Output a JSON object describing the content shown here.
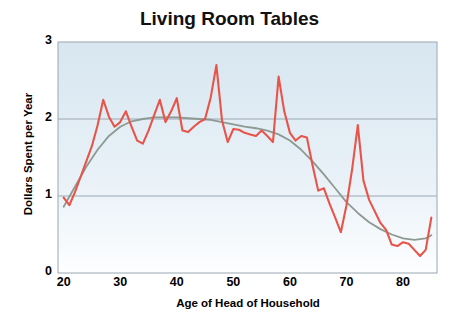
{
  "chart_data": {
    "type": "line",
    "title": "Living Room Tables",
    "xlabel": "Age of Head of Household",
    "ylabel": "Dollars Spent per Year",
    "xlim": [
      19,
      86
    ],
    "ylim": [
      0,
      3
    ],
    "xticks": [
      20,
      30,
      40,
      50,
      60,
      70,
      80
    ],
    "yticks": [
      0,
      1,
      2,
      3
    ],
    "grid": "horizontal-at-1-and-2",
    "legend": "none",
    "colors": {
      "data_line": "#e8544a",
      "trend_line": "#8d9a92",
      "plot_bg_top": "#d7e6f0",
      "plot_bg_bottom": "#fdfeff",
      "axis": "#8c9aa6",
      "gridline": "#9aa8b2",
      "text": "#000000"
    },
    "series": [
      {
        "name": "Dollars spent per year",
        "color": "#e8544a",
        "x": [
          20,
          21,
          22,
          23,
          24,
          25,
          26,
          27,
          28,
          29,
          30,
          31,
          32,
          33,
          34,
          35,
          36,
          37,
          38,
          39,
          40,
          41,
          42,
          43,
          44,
          45,
          46,
          47,
          48,
          49,
          50,
          51,
          52,
          53,
          54,
          55,
          56,
          57,
          58,
          59,
          60,
          61,
          62,
          63,
          64,
          65,
          66,
          67,
          68,
          69,
          70,
          71,
          72,
          73,
          74,
          75,
          76,
          77,
          78,
          79,
          80,
          81,
          82,
          83,
          84,
          85
        ],
        "values": [
          0.98,
          0.88,
          1.05,
          1.25,
          1.45,
          1.65,
          1.92,
          2.25,
          2.03,
          1.9,
          1.96,
          2.1,
          1.9,
          1.72,
          1.68,
          1.85,
          2.05,
          2.25,
          1.96,
          2.1,
          2.27,
          1.85,
          1.83,
          1.9,
          1.96,
          2.0,
          2.28,
          2.7,
          1.98,
          1.7,
          1.87,
          1.86,
          1.82,
          1.8,
          1.78,
          1.85,
          1.78,
          1.7,
          2.55,
          2.1,
          1.82,
          1.72,
          1.78,
          1.76,
          1.4,
          1.07,
          1.1,
          0.9,
          0.72,
          0.53,
          0.88,
          1.35,
          1.92,
          1.2,
          0.95,
          0.8,
          0.65,
          0.56,
          0.37,
          0.35,
          0.4,
          0.38,
          0.3,
          0.22,
          0.3,
          0.72
        ]
      },
      {
        "name": "Smoothed trend",
        "color": "#8d9a92",
        "x": [
          20,
          22,
          24,
          26,
          28,
          30,
          32,
          34,
          36,
          38,
          40,
          42,
          44,
          46,
          48,
          50,
          52,
          54,
          56,
          58,
          60,
          62,
          64,
          66,
          68,
          70,
          72,
          74,
          76,
          78,
          80,
          82,
          84,
          85
        ],
        "values": [
          0.86,
          1.12,
          1.38,
          1.6,
          1.78,
          1.9,
          1.97,
          2.0,
          2.02,
          2.02,
          2.02,
          2.01,
          2.0,
          1.99,
          1.96,
          1.93,
          1.9,
          1.88,
          1.85,
          1.8,
          1.72,
          1.6,
          1.45,
          1.28,
          1.1,
          0.92,
          0.78,
          0.66,
          0.57,
          0.5,
          0.45,
          0.43,
          0.45,
          0.49
        ]
      }
    ]
  }
}
